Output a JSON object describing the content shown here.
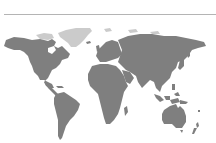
{
  "map": {
    "type": "world-choropleth",
    "colors": {
      "background": "#ffffff",
      "land_default": "#7f7f7f",
      "land_highlight": "#cbcbcb",
      "divider": "#b4b4b4"
    },
    "regions": [
      {
        "name": "North America",
        "fill": "#7f7f7f"
      },
      {
        "name": "Greenland",
        "fill": "#cbcbcb"
      },
      {
        "name": "South America",
        "fill": "#7f7f7f"
      },
      {
        "name": "Europe",
        "fill": "#7f7f7f"
      },
      {
        "name": "Africa",
        "fill": "#7f7f7f"
      },
      {
        "name": "Asia",
        "fill": "#7f7f7f"
      },
      {
        "name": "Australia",
        "fill": "#7f7f7f"
      },
      {
        "name": "New Zealand",
        "fill": "#7f7f7f"
      },
      {
        "name": "Madagascar",
        "fill": "#7f7f7f"
      },
      {
        "name": "Indonesia",
        "fill": "#7f7f7f"
      }
    ]
  }
}
